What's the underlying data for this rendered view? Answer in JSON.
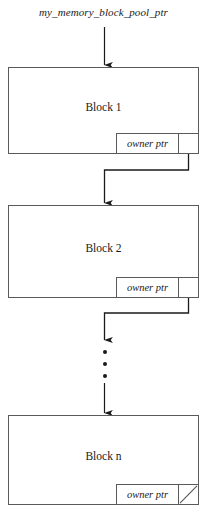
{
  "diagram": {
    "pool_pointer_label": "my_memory_block_pool_ptr",
    "pointer_field_label": "owner ptr",
    "blocks": [
      {
        "title": "Block 1",
        "ptr_label": "owner ptr",
        "is_null": false
      },
      {
        "title": "Block 2",
        "ptr_label": "owner ptr",
        "is_null": false
      },
      {
        "title": "Block n",
        "ptr_label": "owner ptr",
        "is_null": true
      }
    ],
    "ellipsis": "⋮",
    "colors": {
      "stroke": "#5a5a5a",
      "connector": "#1a1a1a",
      "text": "#1a1a1a",
      "background": "#ffffff"
    }
  }
}
